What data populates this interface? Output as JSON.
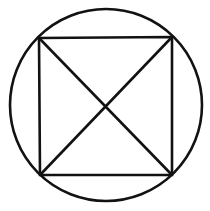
{
  "figure": {
    "canvas": {
      "width": 210,
      "height": 211,
      "background_color": "#ffffff"
    },
    "stroke_color": "#121212",
    "fill_color": "none",
    "shapes": {
      "circle": {
        "name": "outer-circle",
        "center_x": 106,
        "center_y": 105,
        "radius": 96,
        "stroke_width": 2.6
      },
      "square": {
        "name": "inscribed-square",
        "stroke_width": 2.6,
        "points": "39,38 172,37 172,175 40,175",
        "corners": [
          {
            "label": "top-left",
            "x": 39,
            "y": 38
          },
          {
            "label": "top-right",
            "x": 172,
            "y": 37
          },
          {
            "label": "bottom-right",
            "x": 172,
            "y": 175
          },
          {
            "label": "bottom-left",
            "x": 40,
            "y": 175
          }
        ]
      },
      "diagonal_tl_br": {
        "name": "diagonal-top-left-to-bottom-right",
        "x1": 39,
        "y1": 38,
        "x2": 172,
        "y2": 175,
        "stroke_width": 2.6
      },
      "diagonal_tr_bl": {
        "name": "diagonal-top-right-to-bottom-left",
        "x1": 172,
        "y1": 37,
        "x2": 40,
        "y2": 175,
        "stroke_width": 2.6
      },
      "center_point": {
        "name": "diagonal-intersection",
        "x": 106,
        "y": 106
      }
    }
  }
}
